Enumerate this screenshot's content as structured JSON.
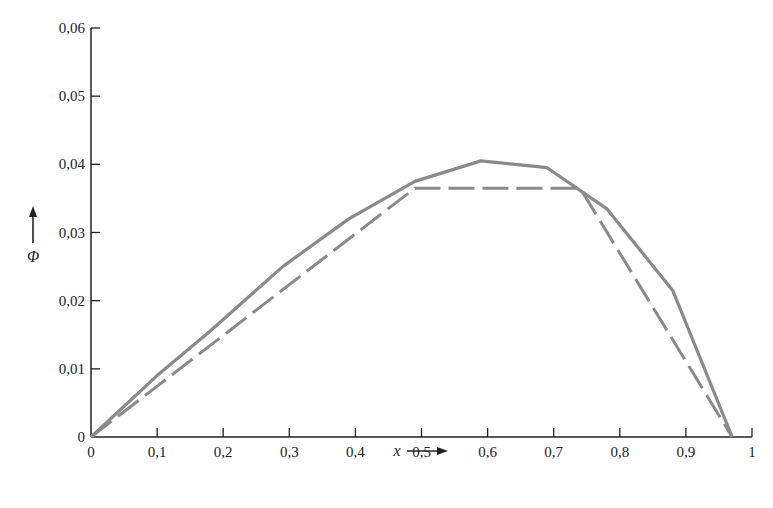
{
  "chart_data": {
    "type": "line",
    "title": "",
    "xlabel": "x",
    "ylabel": "Φ",
    "xlim": [
      0,
      1
    ],
    "ylim": [
      0,
      0.06
    ],
    "grid": false,
    "legend": null,
    "x_ticks": [
      "0",
      "0,1",
      "0,2",
      "0,3",
      "0,4",
      "0,5",
      "0,6",
      "0,7",
      "0,8",
      "0,9",
      "1"
    ],
    "y_ticks": [
      "0",
      "0,01",
      "0,02",
      "0,03",
      "0,04",
      "0,05",
      "0,06"
    ],
    "series": [
      {
        "name": "solid",
        "style": "solid",
        "color": "#8a8a8a",
        "x": [
          0,
          0.1,
          0.18,
          0.29,
          0.39,
          0.49,
          0.59,
          0.69,
          0.78,
          0.88,
          0.97
        ],
        "y": [
          0,
          0.009,
          0.0155,
          0.025,
          0.032,
          0.0375,
          0.0405,
          0.0395,
          0.0335,
          0.0215,
          0
        ]
      },
      {
        "name": "dashed",
        "style": "dashed",
        "color": "#8a8a8a",
        "x": [
          0,
          0.49,
          0.74,
          0.97
        ],
        "y": [
          0,
          0.0365,
          0.0365,
          0
        ]
      }
    ]
  }
}
